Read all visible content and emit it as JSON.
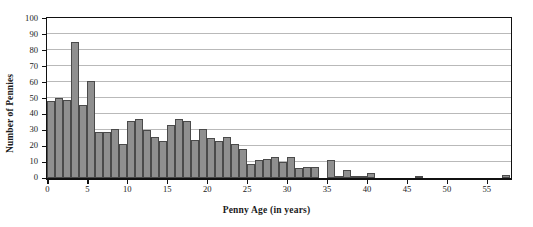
{
  "chart_data": {
    "type": "bar",
    "title": "",
    "xlabel": "Penny Age (in years)",
    "ylabel": "Number of Pennies",
    "xlim": [
      0,
      58
    ],
    "ylim": [
      0,
      100
    ],
    "grid": true,
    "legend": false,
    "bin_width": 1,
    "bar_color": "#8f8f8f",
    "bar_edge_color": "#4a4a4a",
    "x_ticks": [
      0,
      5,
      10,
      15,
      20,
      25,
      30,
      35,
      40,
      45,
      50,
      55
    ],
    "y_ticks": [
      0,
      10,
      20,
      30,
      40,
      50,
      60,
      70,
      80,
      90,
      100
    ],
    "categories": [
      0,
      1,
      2,
      3,
      4,
      5,
      6,
      7,
      8,
      9,
      10,
      11,
      12,
      13,
      14,
      15,
      16,
      17,
      18,
      19,
      20,
      21,
      22,
      23,
      24,
      25,
      26,
      27,
      28,
      29,
      30,
      31,
      32,
      33,
      34,
      35,
      36,
      37,
      38,
      39,
      40,
      41,
      42,
      43,
      44,
      45,
      46,
      47,
      48,
      49,
      50,
      51,
      52,
      53,
      54,
      55,
      56,
      57
    ],
    "values": [
      48,
      50,
      49,
      85,
      46,
      61,
      29,
      29,
      31,
      21,
      36,
      37,
      30,
      26,
      23,
      33,
      37,
      36,
      24,
      31,
      25,
      23,
      26,
      21,
      18,
      9,
      11,
      12,
      13,
      10,
      13,
      6,
      7,
      7,
      0,
      11,
      1,
      5,
      1,
      1,
      3,
      0,
      0,
      0,
      0,
      0,
      1,
      0,
      0,
      0,
      0,
      0,
      0,
      0,
      0,
      0,
      0,
      2
    ]
  }
}
